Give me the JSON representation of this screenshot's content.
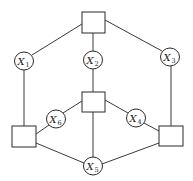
{
  "diagram": {
    "title": "",
    "colors": {
      "stroke": "#2a2a2a",
      "background": "#ffffff"
    },
    "factor_nodes": [
      {
        "id": "top",
        "x": 82,
        "y": 12,
        "w": 23,
        "h": 21
      },
      {
        "id": "center",
        "x": 82,
        "y": 92,
        "w": 23,
        "h": 20
      },
      {
        "id": "left",
        "x": 12,
        "y": 126,
        "w": 24,
        "h": 21
      },
      {
        "id": "right",
        "x": 159,
        "y": 126,
        "w": 24,
        "h": 20
      }
    ],
    "variable_nodes": [
      {
        "id": "X1",
        "letter": "X",
        "sub": "1",
        "cx": 24,
        "cy": 61
      },
      {
        "id": "X2",
        "letter": "X",
        "sub": "2",
        "cx": 93,
        "cy": 60
      },
      {
        "id": "X3",
        "letter": "X",
        "sub": "3",
        "cx": 170,
        "cy": 57
      },
      {
        "id": "X4",
        "letter": "X",
        "sub": "4",
        "cx": 136,
        "cy": 118
      },
      {
        "id": "X5",
        "letter": "X",
        "sub": "5",
        "cx": 93,
        "cy": 166
      },
      {
        "id": "X6",
        "letter": "X",
        "sub": "6",
        "cx": 56,
        "cy": 119
      }
    ],
    "edges": [
      [
        "top",
        "X1"
      ],
      [
        "top",
        "X2"
      ],
      [
        "top",
        "X3"
      ],
      [
        "X1",
        "left"
      ],
      [
        "X2",
        "center"
      ],
      [
        "X3",
        "right"
      ],
      [
        "center",
        "X6"
      ],
      [
        "center",
        "X4"
      ],
      [
        "center",
        "X5"
      ],
      [
        "X6",
        "left"
      ],
      [
        "X4",
        "right"
      ],
      [
        "left",
        "X5"
      ],
      [
        "right",
        "X5"
      ]
    ]
  }
}
